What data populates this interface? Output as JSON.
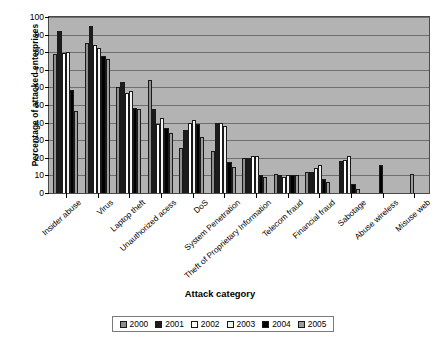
{
  "chart_data": {
    "type": "bar",
    "title": "",
    "xlabel": "Attack category",
    "ylabel": "Percentage of attacked enterprises",
    "ylim": [
      0,
      100
    ],
    "ytick_labels": [
      "0",
      "10",
      "20",
      "30",
      "40",
      "50",
      "60",
      "70",
      "80",
      "90",
      "100"
    ],
    "grid": true,
    "legend_position": "bottom",
    "categories": [
      "Insider abuse",
      "Virus",
      "Laptop theft",
      "Unauthorized acess",
      "DoS",
      "System Penetration",
      "Theft of Proprietary Information",
      "Telecom fraud",
      "Financial fraud",
      "Sabotage",
      "Abuse wireless",
      "Misuse web"
    ],
    "series": [
      {
        "name": "2000",
        "color": "#8e8e8e",
        "values": [
          79,
          85,
          60,
          64,
          25.5,
          24,
          20,
          11,
          12,
          0,
          0,
          0
        ]
      },
      {
        "name": "2001",
        "color": "#1c1c1c",
        "values": [
          92,
          95,
          63,
          47.5,
          36,
          40,
          20,
          10,
          12,
          18,
          0,
          0
        ]
      },
      {
        "name": "2002",
        "color": "#ffffff",
        "values": [
          79.5,
          84,
          57,
          39,
          40,
          40,
          21,
          9,
          14,
          19,
          0,
          0
        ]
      },
      {
        "name": "2003",
        "color": "#f2f2f2",
        "values": [
          80,
          82.5,
          58,
          42.5,
          41.5,
          38,
          21,
          10,
          16,
          21,
          0,
          0
        ]
      },
      {
        "name": "2004",
        "color": "#000000",
        "values": [
          58.5,
          78,
          48.5,
          37,
          39,
          17.5,
          10,
          10,
          8,
          5,
          16,
          0
        ]
      },
      {
        "name": "2005",
        "color": "#9d9d9d",
        "values": [
          46.5,
          76,
          48,
          34,
          32,
          15,
          9,
          10,
          6,
          2,
          0,
          11
        ]
      }
    ],
    "legend": [
      {
        "label": "2000",
        "color": "#8e8e8e"
      },
      {
        "label": "2001",
        "color": "#1c1c1c"
      },
      {
        "label": "2002",
        "color": "#ffffff"
      },
      {
        "label": "2003",
        "color": "#f2f2f2"
      },
      {
        "label": "2004",
        "color": "#000000"
      },
      {
        "label": "2005",
        "color": "#9d9d9d"
      }
    ]
  }
}
